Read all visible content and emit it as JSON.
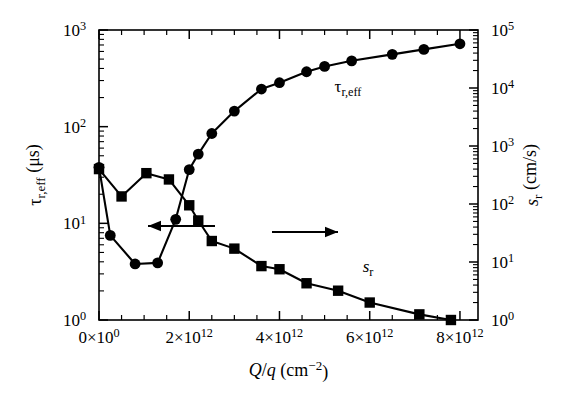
{
  "figure": {
    "title": "",
    "xaxis_label_main": "Q",
    "xaxis_label_slash": "/",
    "xaxis_label_q": "q",
    "xaxis_label_unit": "(cm",
    "xaxis_label_unit_exp": "−2",
    "xaxis_label_unit_close": ")",
    "left_axis_symbol": "τ",
    "left_axis_sub": "r,eff",
    "left_axis_unit": "(μs)",
    "right_axis_symbol": "s",
    "right_axis_sub": "r",
    "right_axis_unit": "(cm/s)",
    "series_label_tau": "τ",
    "series_label_tau_sub": "r,eff",
    "series_label_s": "s",
    "series_label_s_sub": "r",
    "arrow_left_name": "left-arrow-annotation",
    "arrow_right_name": "right-arrow-annotation"
  },
  "chart_data": {
    "type": "line",
    "title": "",
    "xlabel": "Q/q (cm^-2)",
    "ylabel": "τ_r,eff (μs)",
    "y2label": "s_r (cm/s)",
    "xlim": [
      0,
      8400000000000
    ],
    "xscale": "linear",
    "yscale": "log",
    "y2scale": "log",
    "ylim": [
      1,
      1000
    ],
    "y2lim": [
      1,
      100000
    ],
    "grid": false,
    "legend": "inline-annotations",
    "xticks": [
      {
        "value": 0,
        "mantissa": "0",
        "times": "×",
        "base": "10",
        "exp": "0"
      },
      {
        "value": 2000000000000,
        "mantissa": "2",
        "times": "×",
        "base": "10",
        "exp": "12"
      },
      {
        "value": 4000000000000,
        "mantissa": "4",
        "times": "×",
        "base": "10",
        "exp": "12"
      },
      {
        "value": 6000000000000,
        "mantissa": "6",
        "times": "×",
        "base": "10",
        "exp": "12"
      },
      {
        "value": 8000000000000,
        "mantissa": "8",
        "times": "×",
        "base": "10",
        "exp": "12"
      }
    ],
    "yticks_left": [
      {
        "value": 1,
        "base": "10",
        "exp": "0"
      },
      {
        "value": 10,
        "base": "10",
        "exp": "1"
      },
      {
        "value": 100,
        "base": "10",
        "exp": "2"
      },
      {
        "value": 1000,
        "base": "10",
        "exp": "3"
      }
    ],
    "yticks_right": [
      {
        "value": 1,
        "base": "10",
        "exp": "0"
      },
      {
        "value": 10,
        "base": "10",
        "exp": "1"
      },
      {
        "value": 100,
        "base": "10",
        "exp": "2"
      },
      {
        "value": 1000,
        "base": "10",
        "exp": "3"
      },
      {
        "value": 10000,
        "base": "10",
        "exp": "4"
      },
      {
        "value": 100000,
        "base": "10",
        "exp": "5"
      }
    ],
    "series": [
      {
        "name": "τ_r,eff",
        "axis": "left",
        "marker": "circle",
        "color": "#000000",
        "x": [
          0,
          250000000000.0,
          800000000000.0,
          1300000000000.0,
          1700000000000.0,
          2000000000000.0,
          2200000000000.0,
          2500000000000.0,
          3000000000000.0,
          3600000000000.0,
          4000000000000.0,
          4600000000000.0,
          5000000000000.0,
          5600000000000.0,
          6500000000000.0,
          7200000000000.0,
          8000000000000.0
        ],
        "y": [
          38,
          7.5,
          3.8,
          3.9,
          11,
          36,
          52,
          85,
          145,
          245,
          285,
          370,
          420,
          480,
          560,
          630,
          720
        ]
      },
      {
        "name": "s_r",
        "axis": "right",
        "marker": "square",
        "color": "#000000",
        "x": [
          0,
          500000000000.0,
          1050000000000.0,
          1550000000000.0,
          2000000000000.0,
          2200000000000.0,
          2500000000000.0,
          3000000000000.0,
          3600000000000.0,
          4000000000000.0,
          4600000000000.0,
          5300000000000.0,
          6000000000000.0,
          7100000000000.0,
          7800000000000.0
        ],
        "y": [
          400,
          135,
          340,
          265,
          95,
          52,
          23,
          17,
          8.5,
          7.5,
          4.3,
          3.2,
          2.0,
          1.25,
          1.0
        ]
      }
    ],
    "annotations": [
      {
        "text": "τ_r,eff",
        "x_px": 348,
        "y_px": 92
      },
      {
        "text": "s_r",
        "x_px": 368,
        "y_px": 272
      },
      {
        "text": "left-arrow",
        "from_px": [
          215,
          226
        ],
        "to_px": [
          148,
          226
        ]
      },
      {
        "text": "right-arrow",
        "from_px": [
          272,
          232
        ],
        "to_px": [
          338,
          232
        ]
      }
    ]
  }
}
